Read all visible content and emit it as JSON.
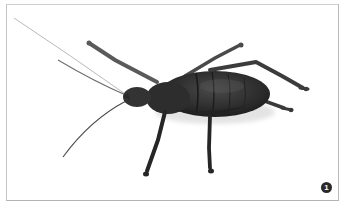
{
  "figure": {
    "badge_number": "1",
    "colors": {
      "background": "#ffffff",
      "frame_border": "#c4c4c4",
      "insect_body": "#2e2e2e",
      "badge": "#2a2a2a"
    }
  }
}
